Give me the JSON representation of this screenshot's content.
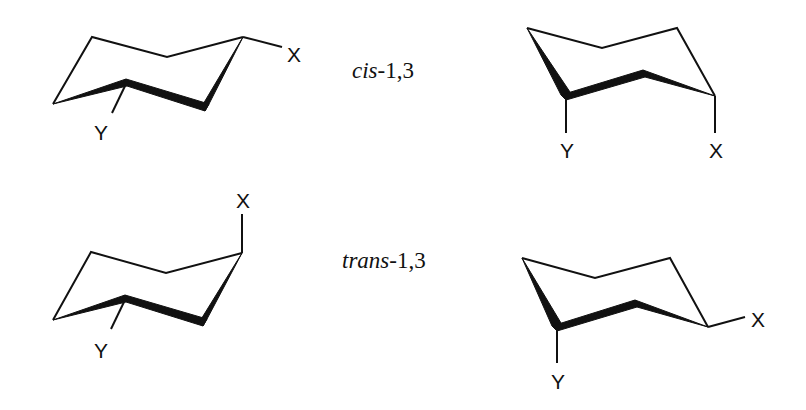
{
  "diagram": {
    "type": "chair conformations of 1,3-disubstituted cyclohexane",
    "rows": [
      {
        "label": {
          "prefix": "cis",
          "suffix": "-1,3"
        },
        "left_conformer": {
          "substituents": [
            "X",
            "Y"
          ]
        },
        "right_conformer": {
          "substituents": [
            "Y",
            "X"
          ]
        }
      },
      {
        "label": {
          "prefix": "trans",
          "suffix": "-1,3"
        },
        "left_conformer": {
          "substituents": [
            "X",
            "Y"
          ]
        },
        "right_conformer": {
          "substituents": [
            "Y",
            "X"
          ]
        }
      }
    ]
  },
  "atoms": {
    "x": "X",
    "y": "Y"
  },
  "colors": {
    "ink": "#111111",
    "background": "#ffffff"
  }
}
